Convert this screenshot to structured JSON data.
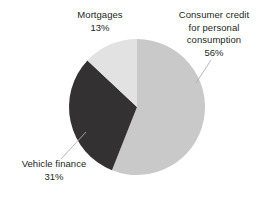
{
  "chart_data": {
    "type": "pie",
    "title": "",
    "subtitle": "",
    "xlabel": "",
    "ylabel": "",
    "legend_position": "none",
    "grid": false,
    "labels_outside": true,
    "units": "percent",
    "categories": [
      "Consumer credit for personal consumption",
      "Vehicle finance",
      "Mortgages"
    ],
    "values": [
      56,
      31,
      13
    ],
    "slices": [
      {
        "label": "Consumer credit for personal consumption",
        "label_lines": [
          "Consumer credit",
          "for personal",
          "consumption"
        ],
        "value": 56,
        "value_text": "56%",
        "color": "#c9c9c9",
        "start_angle_deg": 0,
        "end_angle_deg": 201.6,
        "leader_line": true
      },
      {
        "label": "Vehicle finance",
        "label_lines": [
          "Vehicle finance"
        ],
        "value": 31,
        "value_text": "31%",
        "color": "#333132",
        "start_angle_deg": 201.6,
        "end_angle_deg": 313.2,
        "leader_line": true
      },
      {
        "label": "Mortgages",
        "label_lines": [
          "Mortgages"
        ],
        "value": 13,
        "value_text": "13%",
        "color": "#e2e2e2",
        "start_angle_deg": 313.2,
        "end_angle_deg": 360,
        "leader_line": false
      }
    ]
  },
  "labels": {
    "consumer_credit": {
      "line1": "Consumer credit",
      "line2": "for personal",
      "line3": "consumption",
      "value": "56%"
    },
    "mortgages": {
      "name": "Mortgages",
      "value": "13%"
    },
    "vehicle_finance": {
      "name": "Vehicle finance",
      "value": "31%"
    }
  },
  "colors": {
    "background": "#ffffff",
    "text": "#231f20",
    "consumer_credit": "#c9c9c9",
    "vehicle_finance": "#333132",
    "mortgages": "#e2e2e2",
    "leader_line": "#b0b0b0"
  }
}
